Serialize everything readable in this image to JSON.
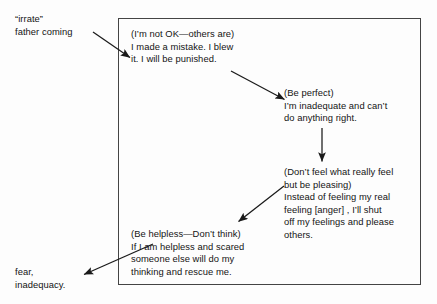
{
  "diagram": {
    "type": "flow-diagram",
    "title": "",
    "background_color": "#fdfdfd",
    "line_color": "#444444",
    "text_color": "#141414",
    "trigger": {
      "label": "“irrate”\nfather coming"
    },
    "outcome": {
      "label": "fear,\ninadequacy."
    },
    "nodes": [
      {
        "id": "not-ok",
        "driver": "(I’m not OK—others are)",
        "text": "(I’m not OK—others are)\nI made a mistake. I blew\nit. I will be punished."
      },
      {
        "id": "be-perfect",
        "driver": "(Be perfect)",
        "text": "(Be perfect)\nI’m inadequate and can’t\ndo anything right."
      },
      {
        "id": "dont-feel",
        "driver": "(Don’t feel what really feel but be pleasing)",
        "text": "(Don’t feel what really feel\nbut be pleasing)\nInstead of feeling my real\nfeeling [anger] , I’ll shut\noff my feelings and please\nothers."
      },
      {
        "id": "be-helpless",
        "driver": "(Be helpless—Don’t think)",
        "text": "(Be helpless—Don’t think)\nIf I am helpless and scared\nsomeone else will do my\nthinking and rescue me."
      }
    ],
    "arrows": [
      {
        "id": "trigger-to-not-ok",
        "from": "trigger",
        "to": "not-ok"
      },
      {
        "id": "not-ok-to-be-perfect",
        "from": "not-ok",
        "to": "be-perfect"
      },
      {
        "id": "be-perfect-to-dont-feel",
        "from": "be-perfect",
        "to": "dont-feel"
      },
      {
        "id": "dont-feel-to-be-helpless",
        "from": "dont-feel",
        "to": "be-helpless"
      },
      {
        "id": "be-helpless-to-outcome",
        "from": "be-helpless",
        "to": "outcome"
      }
    ]
  }
}
